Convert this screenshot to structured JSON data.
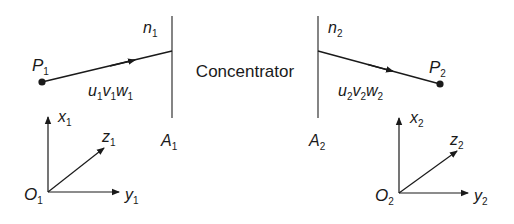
{
  "diagram": {
    "center_label": "Concentrator",
    "left": {
      "point": {
        "name": "P",
        "sub": "1"
      },
      "normal": {
        "name": "n",
        "sub": "1"
      },
      "aperture": {
        "name": "A",
        "sub": "1"
      },
      "direction": [
        {
          "name": "u",
          "sub": "1"
        },
        {
          "name": "v",
          "sub": "1"
        },
        {
          "name": "w",
          "sub": "1"
        }
      ],
      "axes": {
        "origin": {
          "name": "O",
          "sub": "1"
        },
        "x": {
          "name": "x",
          "sub": "1"
        },
        "y": {
          "name": "y",
          "sub": "1"
        },
        "z": {
          "name": "z",
          "sub": "1"
        }
      }
    },
    "right": {
      "point": {
        "name": "P",
        "sub": "2"
      },
      "normal": {
        "name": "n",
        "sub": "2"
      },
      "aperture": {
        "name": "A",
        "sub": "2"
      },
      "direction": [
        {
          "name": "u",
          "sub": "2"
        },
        {
          "name": "v",
          "sub": "2"
        },
        {
          "name": "w",
          "sub": "2"
        }
      ],
      "axes": {
        "origin": {
          "name": "O",
          "sub": "2"
        },
        "x": {
          "name": "x",
          "sub": "2"
        },
        "y": {
          "name": "y",
          "sub": "2"
        },
        "z": {
          "name": "z",
          "sub": "2"
        }
      }
    },
    "colors": {
      "stroke": "#1a1a1a",
      "background": "#ffffff"
    }
  }
}
